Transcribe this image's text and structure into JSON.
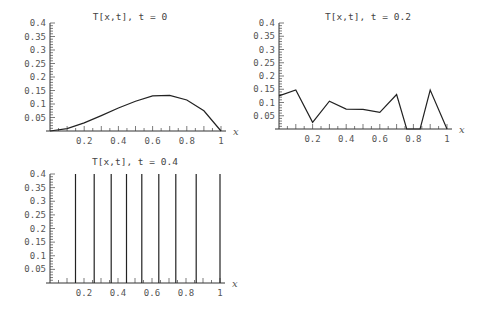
{
  "chart_data": [
    {
      "type": "line",
      "title": "T[x,t], t = 0",
      "xlabel": "x",
      "ylabel": "",
      "xlim": [
        0,
        1
      ],
      "ylim": [
        0,
        0.4
      ],
      "xticks": [
        "0.2",
        "0.4",
        "0.6",
        "0.8",
        "1"
      ],
      "yticks": [
        "0.05",
        "0.1",
        "0.15",
        "0.2",
        "0.25",
        "0.3",
        "0.35",
        "0.4"
      ],
      "x": [
        0,
        0.1,
        0.2,
        0.3,
        0.4,
        0.5,
        0.6,
        0.7,
        0.8,
        0.9,
        1.0
      ],
      "y": [
        0.0,
        0.009,
        0.03,
        0.057,
        0.085,
        0.11,
        0.13,
        0.132,
        0.115,
        0.075,
        0.0
      ],
      "grid": false
    },
    {
      "type": "line",
      "title": "T[x,t], t = 0.2",
      "xlabel": "x",
      "ylabel": "",
      "xlim": [
        0,
        1
      ],
      "ylim": [
        0,
        0.4
      ],
      "xticks": [
        "0.2",
        "0.4",
        "0.6",
        "0.8",
        "1"
      ],
      "yticks": [
        "0.05",
        "0.1",
        "0.15",
        "0.2",
        "0.25",
        "0.3",
        "0.35",
        "0.4"
      ],
      "x": [
        0,
        0.1,
        0.2,
        0.3,
        0.4,
        0.5,
        0.6,
        0.7,
        0.76,
        0.84,
        0.9,
        1.0
      ],
      "y": [
        0.125,
        0.147,
        0.025,
        0.105,
        0.075,
        0.074,
        0.063,
        0.13,
        0.0,
        0.0,
        0.147,
        0.0
      ],
      "grid": false
    },
    {
      "type": "line",
      "title": "T[x,t], t = 0.4",
      "xlabel": "x",
      "ylabel": "",
      "xlim": [
        0,
        1
      ],
      "ylim": [
        0,
        0.4
      ],
      "xticks": [
        "0.2",
        "0.4",
        "0.6",
        "0.8",
        "1"
      ],
      "yticks": [
        "0.05",
        "0.1",
        "0.15",
        "0.2",
        "0.25",
        "0.3",
        "0.35",
        "0.4"
      ],
      "vertical_spikes_x": [
        0.15,
        0.26,
        0.36,
        0.45,
        0.54,
        0.64,
        0.74,
        0.86,
        1.0
      ],
      "note": "Numerical instability: values shoot beyond plotted range (clipped at 0.4)",
      "grid": false
    }
  ]
}
